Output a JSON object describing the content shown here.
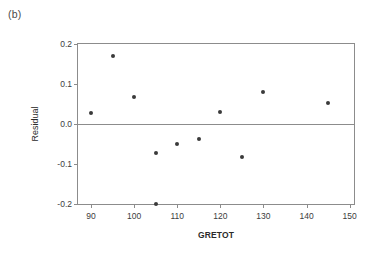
{
  "panel": {
    "label": "(b)"
  },
  "chart_data": {
    "type": "scatter",
    "title": "",
    "subtitle": "",
    "xlabel": "GRETOT",
    "ylabel": "Residual",
    "xlim": [
      87,
      151
    ],
    "ylim": [
      -0.2,
      0.2
    ],
    "xticks": [
      90,
      100,
      110,
      120,
      130,
      140,
      150
    ],
    "xtick_labels": [
      "90",
      "100",
      "110",
      "120",
      "130",
      "140",
      "150"
    ],
    "yticks": [
      0.2,
      0.1,
      0.0,
      -0.1,
      -0.2
    ],
    "ytick_labels": [
      "0.2",
      "0.1",
      "0.0",
      "-0.1",
      "-0.2"
    ],
    "grid": false,
    "legend": null,
    "reference_line": {
      "orientation": "horizontal",
      "value": 0.0,
      "color": "#8c8c8c"
    },
    "marker": {
      "shape": "circle",
      "color": "#3a3a3a",
      "size": 4
    },
    "x": [
      90,
      95,
      100,
      105,
      105,
      110,
      115,
      120,
      125,
      130,
      145
    ],
    "y": [
      0.028,
      0.17,
      0.068,
      -0.072,
      -0.2,
      -0.051,
      -0.038,
      0.03,
      -0.083,
      0.08,
      0.053
    ],
    "points": [
      {
        "x": 90,
        "y": 0.028
      },
      {
        "x": 95,
        "y": 0.17
      },
      {
        "x": 100,
        "y": 0.068
      },
      {
        "x": 105,
        "y": -0.072
      },
      {
        "x": 105,
        "y": -0.2
      },
      {
        "x": 110,
        "y": -0.051
      },
      {
        "x": 115,
        "y": -0.038
      },
      {
        "x": 120,
        "y": 0.03
      },
      {
        "x": 125,
        "y": -0.083
      },
      {
        "x": 130,
        "y": 0.08
      },
      {
        "x": 145,
        "y": 0.053
      }
    ],
    "n_points": 11
  }
}
